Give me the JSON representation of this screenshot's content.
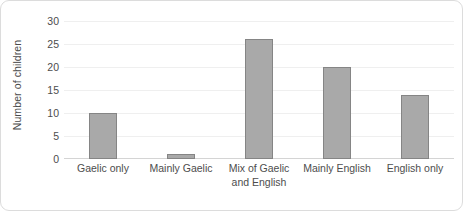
{
  "chart_data": {
    "type": "bar",
    "title": "",
    "xlabel": "",
    "ylabel": "Number of children",
    "categories": [
      "Gaelic only",
      "Mainly Gaelic",
      "Mix of Gaelic and English",
      "Mainly English",
      "English only"
    ],
    "values": [
      10,
      1,
      26,
      20,
      14
    ],
    "ylim": [
      0,
      30
    ],
    "ytick_labels": [
      "0",
      "5",
      "10",
      "15",
      "20",
      "25",
      "30"
    ],
    "ytick_values": [
      0,
      5,
      10,
      15,
      20,
      25,
      30
    ],
    "grid": true,
    "legend": false,
    "colors": {
      "bar_fill": "#a9a9a9",
      "bar_border": "#858585",
      "gridline": "#efefef",
      "axis": "#d4d4d4",
      "text": "#4d4d4d",
      "frame": "#dcdcdc",
      "background": "#ffffff"
    }
  },
  "axis": {
    "y_title": "Number of children"
  },
  "x_label_lines": [
    [
      "Gaelic only"
    ],
    [
      "Mainly Gaelic"
    ],
    [
      "Mix of Gaelic",
      "and English"
    ],
    [
      "Mainly English"
    ],
    [
      "English only"
    ]
  ]
}
